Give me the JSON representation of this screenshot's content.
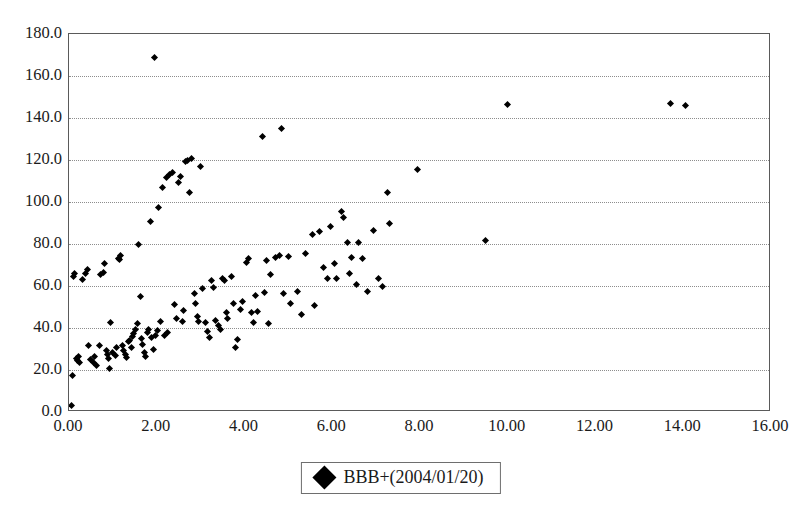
{
  "chart_data": {
    "type": "scatter",
    "title": "",
    "xlabel": "",
    "ylabel": "",
    "xlim": [
      0.0,
      16.0
    ],
    "ylim": [
      0.0,
      180.0
    ],
    "xticks": [
      "0.00",
      "2.00",
      "4.00",
      "6.00",
      "8.00",
      "10.00",
      "12.00",
      "14.00",
      "16.00"
    ],
    "xtick_values": [
      0,
      2,
      4,
      6,
      8,
      10,
      12,
      14,
      16
    ],
    "yticks": [
      "0.0",
      "20.0",
      "40.0",
      "60.0",
      "80.0",
      "100.0",
      "120.0",
      "140.0",
      "160.0",
      "180.0"
    ],
    "ytick_values": [
      0,
      20,
      40,
      60,
      80,
      100,
      120,
      140,
      160,
      180
    ],
    "grid": "horizontal-dotted",
    "legend_position": "bottom-center",
    "marker": "diamond",
    "marker_color": "#000000",
    "frame_color": "#5a5a5a",
    "gridline_color": "#8d8d8d",
    "background_color": "#ffffff",
    "series": [
      {
        "name": "BBB+(2004/01/20)",
        "marker": "diamond",
        "color": "#000000",
        "points": [
          [
            0.05,
            3.0
          ],
          [
            0.07,
            17.5
          ],
          [
            0.1,
            64.5
          ],
          [
            0.12,
            66.0
          ],
          [
            0.18,
            25.5
          ],
          [
            0.2,
            24.5
          ],
          [
            0.22,
            26.5
          ],
          [
            0.25,
            23.5
          ],
          [
            0.3,
            63.0
          ],
          [
            0.38,
            66.0
          ],
          [
            0.42,
            68.0
          ],
          [
            0.45,
            31.5
          ],
          [
            0.5,
            25.0
          ],
          [
            0.55,
            23.5
          ],
          [
            0.58,
            26.5
          ],
          [
            0.62,
            22.0
          ],
          [
            0.7,
            31.5
          ],
          [
            0.72,
            65.5
          ],
          [
            0.78,
            66.5
          ],
          [
            0.82,
            70.5
          ],
          [
            0.85,
            29.5
          ],
          [
            0.88,
            27.5
          ],
          [
            0.9,
            25.5
          ],
          [
            0.92,
            20.5
          ],
          [
            0.95,
            42.5
          ],
          [
            1.0,
            28.5
          ],
          [
            1.05,
            27.0
          ],
          [
            1.08,
            30.5
          ],
          [
            1.12,
            73.0
          ],
          [
            1.15,
            72.5
          ],
          [
            1.18,
            74.5
          ],
          [
            1.22,
            31.5
          ],
          [
            1.25,
            29.5
          ],
          [
            1.28,
            27.5
          ],
          [
            1.32,
            26.0
          ],
          [
            1.35,
            33.5
          ],
          [
            1.38,
            34.0
          ],
          [
            1.42,
            30.5
          ],
          [
            1.45,
            36.0
          ],
          [
            1.48,
            37.5
          ],
          [
            1.52,
            39.5
          ],
          [
            1.55,
            42.0
          ],
          [
            1.58,
            80.0
          ],
          [
            1.62,
            55.0
          ],
          [
            1.65,
            35.0
          ],
          [
            1.68,
            32.0
          ],
          [
            1.72,
            28.5
          ],
          [
            1.75,
            26.5
          ],
          [
            1.78,
            38.0
          ],
          [
            1.82,
            39.5
          ],
          [
            1.85,
            90.5
          ],
          [
            1.88,
            35.5
          ],
          [
            1.92,
            30.0
          ],
          [
            1.95,
            169.0
          ],
          [
            1.98,
            36.5
          ],
          [
            2.02,
            39.0
          ],
          [
            2.05,
            97.5
          ],
          [
            2.08,
            43.0
          ],
          [
            2.12,
            107.0
          ],
          [
            2.18,
            36.5
          ],
          [
            2.22,
            111.5
          ],
          [
            2.25,
            38.0
          ],
          [
            2.3,
            113.0
          ],
          [
            2.35,
            114.0
          ],
          [
            2.4,
            51.0
          ],
          [
            2.45,
            44.5
          ],
          [
            2.5,
            109.5
          ],
          [
            2.55,
            112.0
          ],
          [
            2.58,
            43.0
          ],
          [
            2.62,
            48.5
          ],
          [
            2.65,
            119.5
          ],
          [
            2.7,
            120.0
          ],
          [
            2.75,
            104.5
          ],
          [
            2.8,
            120.5
          ],
          [
            2.85,
            56.5
          ],
          [
            2.88,
            51.5
          ],
          [
            2.92,
            45.5
          ],
          [
            2.95,
            43.0
          ],
          [
            3.0,
            117.0
          ],
          [
            3.05,
            59.0
          ],
          [
            3.1,
            42.5
          ],
          [
            3.15,
            38.5
          ],
          [
            3.2,
            35.5
          ],
          [
            3.25,
            62.5
          ],
          [
            3.3,
            59.5
          ],
          [
            3.35,
            43.5
          ],
          [
            3.4,
            41.0
          ],
          [
            3.45,
            39.5
          ],
          [
            3.5,
            63.5
          ],
          [
            3.55,
            62.5
          ],
          [
            3.58,
            47.5
          ],
          [
            3.62,
            44.5
          ],
          [
            3.7,
            64.5
          ],
          [
            3.75,
            51.5
          ],
          [
            3.8,
            30.5
          ],
          [
            3.85,
            34.5
          ],
          [
            3.9,
            49.0
          ],
          [
            3.95,
            52.5
          ],
          [
            4.05,
            71.0
          ],
          [
            4.1,
            73.0
          ],
          [
            4.15,
            47.5
          ],
          [
            4.2,
            42.5
          ],
          [
            4.25,
            55.5
          ],
          [
            4.3,
            48.0
          ],
          [
            4.4,
            131.0
          ],
          [
            4.45,
            57.0
          ],
          [
            4.5,
            72.0
          ],
          [
            4.55,
            42.0
          ],
          [
            4.6,
            65.5
          ],
          [
            4.7,
            73.5
          ],
          [
            4.8,
            74.5
          ],
          [
            4.85,
            135.0
          ],
          [
            4.9,
            56.5
          ],
          [
            5.0,
            74.0
          ],
          [
            5.05,
            51.5
          ],
          [
            5.2,
            57.5
          ],
          [
            5.3,
            46.5
          ],
          [
            5.4,
            75.5
          ],
          [
            5.55,
            84.5
          ],
          [
            5.6,
            50.5
          ],
          [
            5.7,
            86.0
          ],
          [
            5.8,
            69.0
          ],
          [
            5.9,
            63.5
          ],
          [
            5.95,
            88.5
          ],
          [
            6.05,
            70.5
          ],
          [
            6.1,
            63.5
          ],
          [
            6.2,
            95.5
          ],
          [
            6.25,
            92.5
          ],
          [
            6.35,
            80.5
          ],
          [
            6.4,
            66.0
          ],
          [
            6.45,
            73.5
          ],
          [
            6.55,
            60.5
          ],
          [
            6.6,
            80.5
          ],
          [
            6.7,
            73.0
          ],
          [
            6.8,
            57.5
          ],
          [
            6.95,
            86.5
          ],
          [
            7.05,
            63.5
          ],
          [
            7.15,
            60.0
          ],
          [
            7.25,
            104.5
          ],
          [
            7.3,
            90.0
          ],
          [
            7.95,
            115.5
          ],
          [
            9.5,
            81.5
          ],
          [
            10.0,
            146.5
          ],
          [
            13.7,
            147.0
          ],
          [
            14.05,
            146.0
          ]
        ]
      }
    ]
  },
  "legend": {
    "label": "BBB+(2004/01/20)",
    "marker_name": "diamond-marker"
  }
}
